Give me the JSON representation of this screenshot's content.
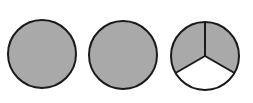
{
  "diagram": {
    "colors": {
      "shaded": "#a9a9a9",
      "unshaded": "#ffffff",
      "stroke": "#1a1a1a"
    },
    "circles": [
      {
        "cx": 42,
        "cy": 54,
        "r": 34,
        "parts": 1,
        "shaded_parts": 1
      },
      {
        "cx": 123,
        "cy": 55,
        "r": 34,
        "parts": 1,
        "shaded_parts": 1
      },
      {
        "cx": 205,
        "cy": 56,
        "r": 34,
        "parts": 3,
        "shaded_parts": 2
      }
    ]
  }
}
